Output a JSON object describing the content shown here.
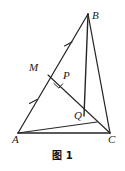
{
  "figure": {
    "caption": "图 1",
    "type": "euclidean-geometry-diagram",
    "stroke_color": "#262626",
    "background_color": "#ffffff",
    "points": {
      "A": {
        "label": "A",
        "x": 18,
        "y": 133
      },
      "B": {
        "label": "B",
        "x": 88,
        "y": 14
      },
      "C": {
        "label": "C",
        "x": 110,
        "y": 133
      },
      "M": {
        "label": "M",
        "x": 49,
        "y": 74
      },
      "P": {
        "label": "P",
        "x": 60,
        "y": 82
      },
      "Q": {
        "label": "Q",
        "x": 83,
        "y": 114
      }
    },
    "segments": [
      {
        "name": "AB",
        "from": "A",
        "to": "B"
      },
      {
        "name": "AC",
        "from": "A",
        "to": "C"
      },
      {
        "name": "BC",
        "from": "B",
        "to": "C"
      },
      {
        "name": "AQ",
        "from": "A",
        "to": "Q"
      },
      {
        "name": "MQ",
        "from": "M",
        "to": "Q"
      },
      {
        "name": "BQ",
        "from": "B",
        "to": "Q"
      }
    ],
    "tick_marks": [
      {
        "name": "tick-AM",
        "on": "AM",
        "x": 33,
        "y": 103,
        "count": 1
      },
      {
        "name": "tick-MB",
        "on": "MB",
        "x": 68,
        "y": 44,
        "count": 1
      }
    ],
    "right_angle": {
      "name": "right-angle-at-P",
      "at": "P",
      "size": 7
    }
  }
}
